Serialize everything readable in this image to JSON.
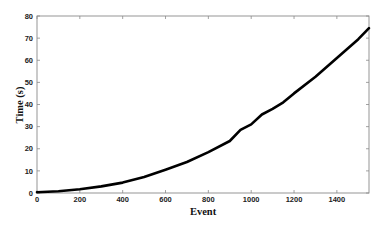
{
  "chart_data": {
    "type": "line",
    "title": "",
    "xlabel": "Event",
    "ylabel": "Time (s)",
    "xlim": [
      0,
      1550
    ],
    "ylim": [
      0,
      80
    ],
    "xticks": [
      0,
      200,
      400,
      600,
      800,
      1000,
      1200,
      1400
    ],
    "yticks": [
      0,
      10,
      20,
      30,
      40,
      50,
      60,
      70,
      80
    ],
    "grid": false,
    "legend": null,
    "series": [
      {
        "name": "Time",
        "color": "#000000",
        "x": [
          0,
          100,
          200,
          300,
          400,
          500,
          600,
          700,
          800,
          900,
          950,
          1000,
          1050,
          1100,
          1150,
          1200,
          1300,
          1400,
          1500,
          1550
        ],
        "y": [
          0.3,
          0.8,
          1.7,
          3.0,
          4.7,
          7.2,
          10.5,
          14.0,
          18.5,
          23.5,
          28.5,
          31.0,
          35.5,
          38.0,
          41.0,
          45.0,
          52.5,
          61.0,
          69.5,
          74.5
        ]
      }
    ]
  }
}
